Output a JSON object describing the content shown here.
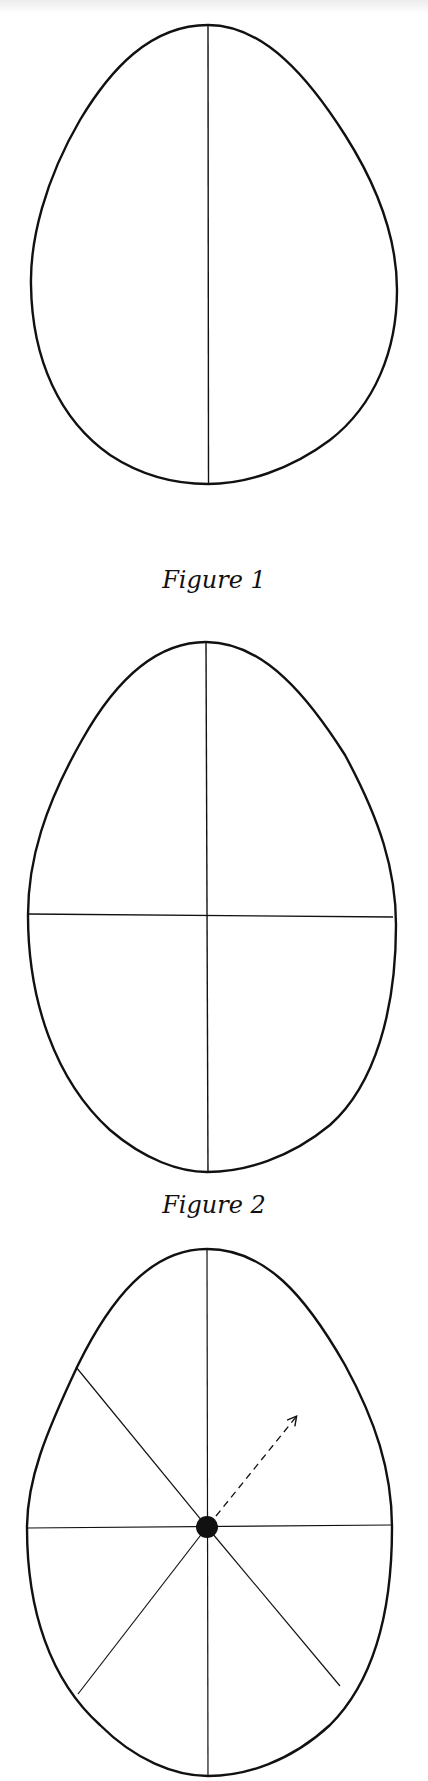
{
  "figures": [
    {
      "caption": "Figure 1",
      "description": "Egg outline divided by a vertical center line",
      "lines": [
        "vertical"
      ]
    },
    {
      "caption": "Figure 2",
      "description": "Egg outline divided into four sections by a vertical and a horizontal line",
      "lines": [
        "vertical",
        "horizontal"
      ]
    },
    {
      "caption": "",
      "description": "Egg outline divided into eight sections by radiating lines from a center dot, with a dashed arrow pointing up-right",
      "lines": [
        "vertical",
        "horizontal",
        "diagonal-upper-left",
        "diagonal-lower-left",
        "diagonal-lower-right"
      ],
      "center_marker": "filled-dot",
      "arrow": "dashed, pointing up-right"
    }
  ],
  "colors": {
    "ink": "#111111",
    "paper": "#ffffff"
  }
}
